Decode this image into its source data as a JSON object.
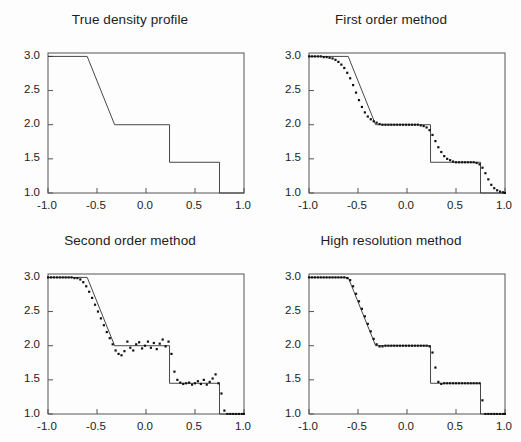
{
  "figure": {
    "background_color": "#fdfdfd",
    "line_color": "#333333",
    "marker_color": "#111111",
    "axis_color": "#555555"
  },
  "axes": {
    "xlabel": "",
    "ylabel": "",
    "xlim": [
      -1.0,
      1.0
    ],
    "ylim": [
      1.0,
      3.05
    ],
    "xticks": [
      "-1.0",
      "-0.5",
      "0.0",
      "0.5",
      "1.0"
    ],
    "xtick_values": [
      -1.0,
      -0.5,
      0.0,
      0.5,
      1.0
    ],
    "yticks": [
      "3.0",
      "2.5",
      "2.0",
      "1.5",
      "1.0"
    ],
    "ytick_values": [
      3.0,
      2.5,
      2.0,
      1.5,
      1.0
    ],
    "grid": false,
    "legend": "none"
  },
  "panels": [
    {
      "id": "true-density-profile",
      "title": "True density profile",
      "position": {
        "left": 0,
        "top": 0
      }
    },
    {
      "id": "first-order-method",
      "title": "First order method",
      "position": {
        "left": 261,
        "top": 0
      }
    },
    {
      "id": "second-order-method",
      "title": "Second order method",
      "position": {
        "left": 0,
        "top": 221
      }
    },
    {
      "id": "high-resolution-method",
      "title": "High resolution method",
      "position": {
        "left": 261,
        "top": 221
      }
    }
  ],
  "chart_data": [
    {
      "type": "line",
      "title": "True density profile",
      "xlabel": "",
      "ylabel": "",
      "xlim": [
        -1.0,
        1.0
      ],
      "ylim": [
        1.0,
        3.05
      ],
      "grid": false,
      "legend": "none",
      "series": [
        {
          "name": "exact solution",
          "style": "thin-line",
          "x": [
            -1.0,
            -0.6,
            -0.32,
            0.24,
            0.24,
            0.75,
            0.75,
            1.0
          ],
          "values": [
            3.0,
            3.0,
            2.0,
            2.0,
            1.45,
            1.45,
            1.0,
            1.0
          ]
        }
      ]
    },
    {
      "type": "scatter",
      "title": "First order method",
      "xlabel": "",
      "ylabel": "",
      "xlim": [
        -1.0,
        1.0
      ],
      "ylim": [
        1.0,
        3.05
      ],
      "grid": false,
      "legend": "none",
      "series": [
        {
          "name": "exact solution",
          "style": "thin-line",
          "x": [
            -1.0,
            -0.6,
            -0.32,
            0.24,
            0.24,
            0.75,
            0.75,
            1.0
          ],
          "values": [
            3.0,
            3.0,
            2.0,
            2.0,
            1.45,
            1.45,
            1.0,
            1.0
          ]
        },
        {
          "name": "first order numerical solution",
          "style": "dots",
          "x": [
            -1.0,
            -0.97,
            -0.94,
            -0.91,
            -0.88,
            -0.85,
            -0.82,
            -0.79,
            -0.76,
            -0.73,
            -0.7,
            -0.67,
            -0.64,
            -0.61,
            -0.58,
            -0.55,
            -0.52,
            -0.49,
            -0.46,
            -0.43,
            -0.4,
            -0.37,
            -0.34,
            -0.31,
            -0.28,
            -0.25,
            -0.22,
            -0.19,
            -0.16,
            -0.13,
            -0.1,
            -0.07,
            -0.04,
            -0.01,
            0.02,
            0.05,
            0.08,
            0.11,
            0.14,
            0.17,
            0.2,
            0.23,
            0.26,
            0.29,
            0.32,
            0.35,
            0.38,
            0.41,
            0.44,
            0.47,
            0.5,
            0.53,
            0.56,
            0.59,
            0.62,
            0.65,
            0.68,
            0.71,
            0.74,
            0.77,
            0.8,
            0.83,
            0.86,
            0.89,
            0.92,
            0.95,
            0.98,
            1.0
          ],
          "values": [
            3.0,
            3.0,
            3.0,
            3.0,
            3.0,
            2.99,
            2.99,
            2.98,
            2.97,
            2.95,
            2.92,
            2.88,
            2.83,
            2.76,
            2.68,
            2.58,
            2.47,
            2.36,
            2.26,
            2.18,
            2.12,
            2.08,
            2.05,
            2.03,
            2.01,
            2.0,
            2.0,
            2.0,
            2.0,
            2.0,
            2.0,
            2.0,
            2.0,
            2.0,
            2.0,
            2.0,
            2.0,
            2.0,
            1.99,
            1.98,
            1.96,
            1.92,
            1.85,
            1.76,
            1.67,
            1.6,
            1.54,
            1.5,
            1.48,
            1.46,
            1.45,
            1.45,
            1.45,
            1.45,
            1.45,
            1.45,
            1.45,
            1.44,
            1.42,
            1.37,
            1.29,
            1.2,
            1.12,
            1.07,
            1.04,
            1.02,
            1.01,
            1.0
          ]
        }
      ]
    },
    {
      "type": "scatter",
      "title": "Second order method",
      "xlabel": "",
      "ylabel": "",
      "xlim": [
        -1.0,
        1.0
      ],
      "ylim": [
        1.0,
        3.05
      ],
      "grid": false,
      "legend": "none",
      "series": [
        {
          "name": "exact solution",
          "style": "thin-line",
          "x": [
            -1.0,
            -0.6,
            -0.32,
            0.24,
            0.24,
            0.75,
            0.75,
            1.0
          ],
          "values": [
            3.0,
            3.0,
            2.0,
            2.0,
            1.45,
            1.45,
            1.0,
            1.0
          ]
        },
        {
          "name": "second order numerical solution",
          "style": "dots",
          "x": [
            -1.0,
            -0.97,
            -0.94,
            -0.91,
            -0.88,
            -0.85,
            -0.82,
            -0.79,
            -0.76,
            -0.73,
            -0.7,
            -0.67,
            -0.64,
            -0.61,
            -0.58,
            -0.55,
            -0.52,
            -0.49,
            -0.46,
            -0.43,
            -0.4,
            -0.37,
            -0.34,
            -0.31,
            -0.28,
            -0.25,
            -0.22,
            -0.19,
            -0.16,
            -0.13,
            -0.1,
            -0.07,
            -0.04,
            -0.01,
            0.02,
            0.05,
            0.08,
            0.11,
            0.14,
            0.17,
            0.2,
            0.23,
            0.26,
            0.29,
            0.32,
            0.35,
            0.38,
            0.41,
            0.44,
            0.47,
            0.5,
            0.53,
            0.56,
            0.59,
            0.62,
            0.65,
            0.68,
            0.71,
            0.74,
            0.77,
            0.8,
            0.83,
            0.86,
            0.89,
            0.92,
            0.95,
            0.98,
            1.0
          ],
          "values": [
            3.0,
            3.0,
            3.0,
            3.0,
            3.0,
            3.0,
            3.0,
            3.0,
            3.0,
            2.99,
            2.99,
            2.97,
            2.93,
            2.87,
            2.79,
            2.7,
            2.6,
            2.5,
            2.4,
            2.3,
            2.2,
            2.11,
            2.02,
            1.93,
            1.88,
            1.86,
            1.92,
            2.06,
            1.97,
            1.93,
            2.02,
            2.05,
            1.96,
            2.0,
            2.06,
            1.97,
            2.04,
            1.95,
            2.03,
            2.09,
            1.99,
            2.06,
            1.88,
            1.62,
            1.5,
            1.46,
            1.44,
            1.45,
            1.46,
            1.43,
            1.45,
            1.48,
            1.44,
            1.5,
            1.43,
            1.47,
            1.52,
            1.58,
            1.45,
            1.3,
            1.05,
            1.0,
            1.0,
            1.0,
            1.0,
            1.0,
            1.0,
            1.0
          ]
        }
      ]
    },
    {
      "type": "scatter",
      "title": "High resolution method",
      "xlabel": "",
      "ylabel": "",
      "xlim": [
        -1.0,
        1.0
      ],
      "ylim": [
        1.0,
        3.05
      ],
      "grid": false,
      "legend": "none",
      "series": [
        {
          "name": "exact solution",
          "style": "thin-line",
          "x": [
            -1.0,
            -0.6,
            -0.32,
            0.24,
            0.24,
            0.75,
            0.75,
            1.0
          ],
          "values": [
            3.0,
            3.0,
            2.0,
            2.0,
            1.45,
            1.45,
            1.0,
            1.0
          ]
        },
        {
          "name": "high resolution numerical solution",
          "style": "dots",
          "x": [
            -1.0,
            -0.97,
            -0.94,
            -0.91,
            -0.88,
            -0.85,
            -0.82,
            -0.79,
            -0.76,
            -0.73,
            -0.7,
            -0.67,
            -0.64,
            -0.61,
            -0.58,
            -0.55,
            -0.52,
            -0.49,
            -0.46,
            -0.43,
            -0.4,
            -0.37,
            -0.34,
            -0.31,
            -0.28,
            -0.25,
            -0.22,
            -0.19,
            -0.16,
            -0.13,
            -0.1,
            -0.07,
            -0.04,
            -0.01,
            0.02,
            0.05,
            0.08,
            0.11,
            0.14,
            0.17,
            0.2,
            0.23,
            0.26,
            0.29,
            0.32,
            0.35,
            0.38,
            0.41,
            0.44,
            0.47,
            0.5,
            0.53,
            0.56,
            0.59,
            0.62,
            0.65,
            0.68,
            0.71,
            0.74,
            0.77,
            0.8,
            0.83,
            0.86,
            0.89,
            0.92,
            0.95,
            0.98,
            1.0
          ],
          "values": [
            3.0,
            3.0,
            3.0,
            3.0,
            3.0,
            3.0,
            3.0,
            3.0,
            3.0,
            3.0,
            3.0,
            3.0,
            3.0,
            2.99,
            2.96,
            2.87,
            2.76,
            2.65,
            2.54,
            2.43,
            2.32,
            2.21,
            2.1,
            2.02,
            1.99,
            1.99,
            2.0,
            2.0,
            2.0,
            2.0,
            2.0,
            2.0,
            2.0,
            2.0,
            2.0,
            2.0,
            2.0,
            2.0,
            2.0,
            2.0,
            2.0,
            1.99,
            1.9,
            1.68,
            1.47,
            1.44,
            1.45,
            1.45,
            1.45,
            1.45,
            1.45,
            1.45,
            1.45,
            1.45,
            1.45,
            1.45,
            1.45,
            1.45,
            1.45,
            1.2,
            1.0,
            1.0,
            1.0,
            1.0,
            1.0,
            1.0,
            1.0,
            1.0
          ]
        }
      ]
    }
  ]
}
